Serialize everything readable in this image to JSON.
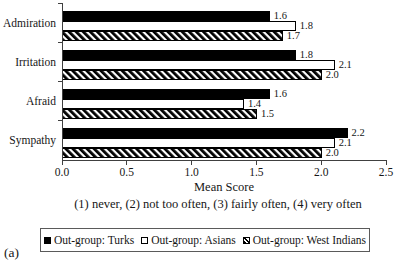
{
  "figure": {
    "panel_label": "(a)",
    "caption": "(1) never, (2) not too often, (3) fairly often, (4) very often"
  },
  "chart_data": {
    "type": "bar",
    "orientation": "horizontal",
    "title": "",
    "xlabel": "Mean Score",
    "xlim": [
      0,
      2.5
    ],
    "xticks": [
      "0.0",
      "0.5",
      "1.0",
      "1.5",
      "2.0",
      "2.5"
    ],
    "grid": false,
    "value_labels": true,
    "legend_position": "bottom",
    "categories": [
      "Admiration",
      "Irritation",
      "Afraid",
      "Sympathy"
    ],
    "series": [
      {
        "name": "Out-group: Turks",
        "style": "solid-black",
        "values": [
          1.6,
          1.8,
          1.6,
          2.2
        ]
      },
      {
        "name": "Out-group: Asians",
        "style": "white-outline",
        "values": [
          1.8,
          2.1,
          1.4,
          2.1
        ]
      },
      {
        "name": "Out-group: West Indians",
        "style": "diagonal-hatch",
        "values": [
          1.7,
          2.0,
          1.5,
          2.0
        ]
      }
    ],
    "colors": {
      "foreground": "#000000",
      "background": "#ffffff",
      "axis": "#404040"
    }
  }
}
